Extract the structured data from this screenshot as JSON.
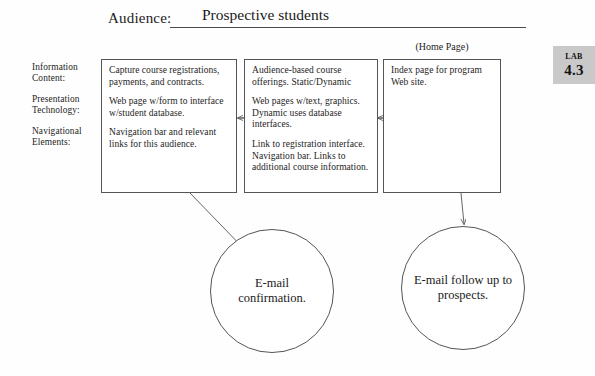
{
  "header": {
    "field_label": "Audience:",
    "field_value": "Prospective students"
  },
  "row_labels": {
    "information_content": "Information Content:",
    "presentation_technology": "Presentation Technology:",
    "navigational_elements": "Navigational Elements:"
  },
  "boxes": {
    "information": {
      "caption": "",
      "paragraphs": [
        "Capture course registrations, payments, and contracts.",
        "Web page w/form to interface w/student database.",
        "Navigation bar and relevant links for this audience."
      ]
    },
    "presentation": {
      "caption": "",
      "paragraphs": [
        "Audience-based course offerings. Static/Dynamic",
        "Web pages w/text, graphics. Dynamic uses database interfaces.",
        "Link to registration interface. Navigation bar. Links to additional course information."
      ]
    },
    "navigation": {
      "caption": "(Home Page)",
      "paragraphs": [
        "Index page for program Web site."
      ]
    }
  },
  "circles": {
    "confirmation": "E-mail confirmation.",
    "followup": "E-mail follow up to prospects."
  },
  "lab_tab": {
    "word": "Lab",
    "number": "4.3",
    "background": "#c9c9c9"
  },
  "colors": {
    "page_background": "#fefefe",
    "ink": "#1a1a1a",
    "stroke": "#555555"
  }
}
